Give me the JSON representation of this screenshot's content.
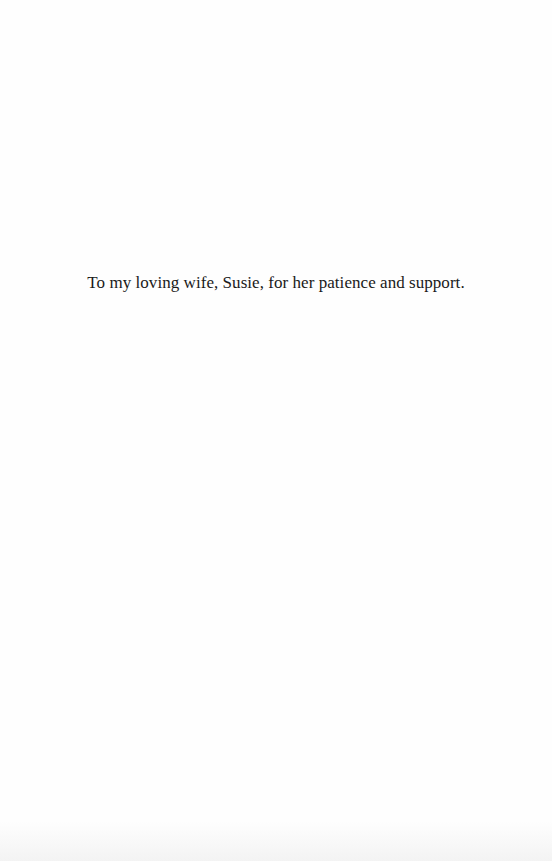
{
  "page": {
    "dedication": "To my loving wife, Susie, for her patience and support."
  }
}
